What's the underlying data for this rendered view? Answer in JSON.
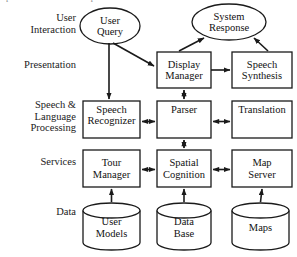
{
  "figure": {
    "title_sliver": "presentation of the component modules.",
    "background_color": "#ffffff",
    "stroke_color": "#1a1a1a",
    "width": 297,
    "height": 257
  },
  "row_labels": [
    {
      "id": "user-interaction",
      "text": "User\nInteraction",
      "x": 2,
      "y": 12,
      "w": 74
    },
    {
      "id": "presentation",
      "text": "Presentation",
      "x": 2,
      "y": 59,
      "w": 74
    },
    {
      "id": "speech-language-processing",
      "text": "Speech &\nLanguage\nProcessing",
      "x": 2,
      "y": 99,
      "w": 74
    },
    {
      "id": "services",
      "text": "Services",
      "x": 2,
      "y": 156,
      "w": 74
    },
    {
      "id": "data",
      "text": "Data",
      "x": 2,
      "y": 206,
      "w": 74
    }
  ],
  "ellipses": [
    {
      "id": "user-query",
      "label": "User\nQuery",
      "cx": 110,
      "cy": 26,
      "rx": 30,
      "ry": 18
    },
    {
      "id": "system-response",
      "label": "System\nResponse",
      "cx": 229,
      "cy": 22,
      "rx": 37,
      "ry": 18
    }
  ],
  "boxes": [
    {
      "id": "display-manager",
      "label": "Display\nManager",
      "x": 157,
      "y": 52,
      "w": 54,
      "h": 36,
      "align": "middle"
    },
    {
      "id": "speech-synthesis",
      "label": "Speech\nSynthesis",
      "x": 232,
      "y": 52,
      "w": 60,
      "h": 36,
      "align": "middle"
    },
    {
      "id": "speech-recognizer",
      "label": "Speech\nRecognizer",
      "x": 83,
      "y": 101,
      "w": 57,
      "h": 37,
      "align": "top"
    },
    {
      "id": "parser",
      "label": "Parser",
      "x": 157,
      "y": 101,
      "w": 54,
      "h": 37,
      "align": "top"
    },
    {
      "id": "translation",
      "label": "Translation",
      "x": 232,
      "y": 101,
      "w": 60,
      "h": 37,
      "align": "top"
    },
    {
      "id": "tour-manager",
      "label": "Tour\nManager",
      "x": 83,
      "y": 150,
      "w": 57,
      "h": 37,
      "align": "middle"
    },
    {
      "id": "spatial-cognition",
      "label": "Spatial\nCognition",
      "x": 157,
      "y": 150,
      "w": 54,
      "h": 37,
      "align": "middle"
    },
    {
      "id": "map-server",
      "label": "Map\nServer",
      "x": 232,
      "y": 150,
      "w": 60,
      "h": 37,
      "align": "middle"
    }
  ],
  "cylinders": [
    {
      "id": "user-models",
      "label": "User\nModels",
      "x": 83,
      "y": 203,
      "w": 57,
      "h": 47
    },
    {
      "id": "data-base",
      "label": "Data\nBase",
      "x": 157,
      "y": 203,
      "w": 54,
      "h": 47
    },
    {
      "id": "maps",
      "label": "Maps",
      "x": 232,
      "y": 203,
      "w": 57,
      "h": 47
    }
  ],
  "connections": [
    {
      "id": "user-query-to-display-manager",
      "from": "user-query",
      "to": "display-manager",
      "style": "single-arrow"
    },
    {
      "id": "user-query-to-speech-recognizer",
      "from": "user-query",
      "to": "speech-recognizer",
      "style": "single-arrow"
    },
    {
      "id": "display-manager-to-system-response",
      "from": "display-manager",
      "to": "system-response",
      "style": "single-arrow"
    },
    {
      "id": "speech-synthesis-to-system-response",
      "from": "speech-synthesis",
      "to": "system-response",
      "style": "single-arrow"
    },
    {
      "id": "display-manager-to-speech-synthesis",
      "from": "display-manager",
      "to": "speech-synthesis",
      "style": "single-arrow"
    },
    {
      "id": "display-manager-parser",
      "from": "display-manager",
      "to": "parser",
      "style": "double-arrow"
    },
    {
      "id": "speech-recognizer-parser",
      "from": "speech-recognizer",
      "to": "parser",
      "style": "double-arrow"
    },
    {
      "id": "parser-translation",
      "from": "parser",
      "to": "translation",
      "style": "double-arrow"
    },
    {
      "id": "parser-spatial-cognition",
      "from": "parser",
      "to": "spatial-cognition",
      "style": "double-arrow"
    },
    {
      "id": "tour-manager-spatial-cognition",
      "from": "tour-manager",
      "to": "spatial-cognition",
      "style": "double-arrow"
    },
    {
      "id": "spatial-cognition-map-server",
      "from": "spatial-cognition",
      "to": "map-server",
      "style": "double-arrow"
    },
    {
      "id": "user-models-to-tour-manager",
      "from": "user-models",
      "to": "tour-manager",
      "style": "single-arrow"
    },
    {
      "id": "data-base-to-spatial-cognition",
      "from": "data-base",
      "to": "spatial-cognition",
      "style": "single-arrow"
    },
    {
      "id": "maps-to-map-server",
      "from": "maps",
      "to": "map-server",
      "style": "single-arrow"
    }
  ]
}
